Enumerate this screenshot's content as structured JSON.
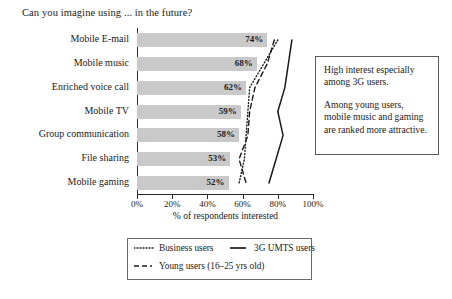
{
  "title": "Can you imagine using ... in the future?",
  "axis": {
    "x_caption": "% of respondents interested",
    "x_ticks": [
      "0%",
      "20%",
      "40%",
      "60%",
      "80%",
      "100%"
    ]
  },
  "annotation": {
    "paragraph_1": "High interest especially among 3G users.",
    "paragraph_2": "Among young users, mobile music and gaming are ranked more attractive."
  },
  "legend": {
    "business": "Business users",
    "umts": "3G UMTS users",
    "young": "Young users (16–25 yrs old)"
  },
  "chart_data": {
    "type": "bar",
    "title": "Can you imagine using ... in the future?",
    "xlabel": "% of respondents interested",
    "ylabel": "",
    "xlim": [
      0,
      100
    ],
    "grid": false,
    "legend_position": "below-axis",
    "categories": [
      "Mobile E-mail",
      "Mobile music",
      "Enriched voice call",
      "Mobile TV",
      "Group communication",
      "File sharing",
      "Mobile gaming"
    ],
    "values": [
      74,
      68,
      62,
      59,
      58,
      53,
      52
    ],
    "value_labels": [
      "74%",
      "68%",
      "62%",
      "59%",
      "58%",
      "53%",
      "52%"
    ],
    "series": [
      {
        "name": "Business users",
        "style": "dotted",
        "values": [
          80,
          72,
          64,
          63,
          62,
          61,
          58
        ]
      },
      {
        "name": "Young users (16–25 yrs old)",
        "style": "dashed",
        "values": [
          78,
          74,
          67,
          64,
          63,
          58,
          62
        ]
      },
      {
        "name": "3G UMTS users",
        "style": "solid",
        "values": [
          88,
          86,
          84,
          80,
          83,
          79,
          75
        ]
      }
    ]
  }
}
